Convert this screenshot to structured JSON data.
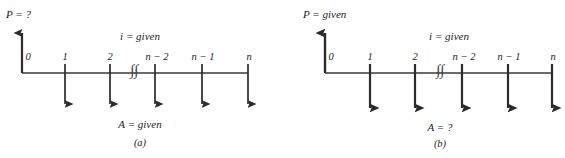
{
  "figure": {
    "background_color": "#ffffff",
    "ink_color": "#1c1c1c"
  },
  "panels": [
    {
      "id": "a",
      "caption": "(a)",
      "top_label": "P = ?",
      "interest_label": "i = given",
      "bottom_label": "A = given",
      "up_arrow": {
        "name": "present-worth-arrow",
        "direction": "up",
        "at_period": "0"
      },
      "break_symbol": "∫∫",
      "periods": [
        {
          "label": "0",
          "x": 22,
          "arrow": "none"
        },
        {
          "label": "1",
          "x": 65,
          "arrow": "down"
        },
        {
          "label": "2",
          "x": 110,
          "arrow": "down"
        },
        {
          "label": "n − 2",
          "x": 155,
          "arrow": "down"
        },
        {
          "label": "n − 1",
          "x": 202,
          "arrow": "down"
        },
        {
          "label": "n",
          "x": 248,
          "arrow": "down"
        }
      ]
    },
    {
      "id": "b",
      "caption": "(b)",
      "top_label": "P = given",
      "interest_label": "i = given",
      "bottom_label": "A = ?",
      "up_arrow": {
        "name": "present-worth-arrow",
        "direction": "up",
        "at_period": "0"
      },
      "break_symbol": "∫∫",
      "periods": [
        {
          "label": "0",
          "x": 42,
          "arrow": "none"
        },
        {
          "label": "1",
          "x": 87,
          "arrow": "down"
        },
        {
          "label": "2",
          "x": 132,
          "arrow": "down"
        },
        {
          "label": "n − 2",
          "x": 179,
          "arrow": "down"
        },
        {
          "label": "n − 1",
          "x": 225,
          "arrow": "down"
        },
        {
          "label": "n",
          "x": 269,
          "arrow": "down"
        }
      ]
    }
  ]
}
